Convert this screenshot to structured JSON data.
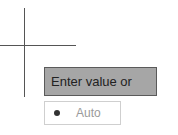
{
  "cursor": {
    "type": "crosshair"
  },
  "value_input": {
    "placeholder": "Enter value or",
    "background_color": "#a6a6a6"
  },
  "auto_option": {
    "label": "Auto",
    "icon": "bullet-dot-icon"
  }
}
